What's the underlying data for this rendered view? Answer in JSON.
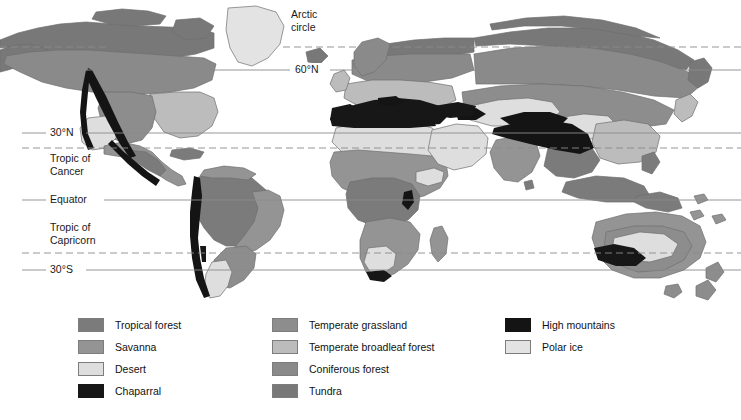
{
  "map": {
    "title": "World biomes map",
    "background_color": "#ffffff",
    "ocean_color": "#ffffff",
    "coastline_color": "#6e6e6e",
    "graticule_color": "#8a8a8a",
    "latitude_lines": [
      {
        "id": "arctic-circle",
        "label": "Arctic circle",
        "style": "dashed",
        "y": 47,
        "label_x": 292,
        "label_y": 10,
        "two_line": true,
        "line1": "Arctic",
        "line2": "circle"
      },
      {
        "id": "sixty-north",
        "label": "60°N",
        "style": "solid",
        "y": 70,
        "label_x": 296,
        "label_y": 63
      },
      {
        "id": "thirty-north",
        "label": "30°N",
        "style": "solid",
        "y": 133,
        "label_x": 52,
        "label_y": 126
      },
      {
        "id": "tropic-of-cancer",
        "label": "Tropic of Cancer",
        "style": "dashed",
        "y": 148,
        "label_x": 52,
        "label_y": 152,
        "two_line": true,
        "line1": "Tropic of",
        "line2": "Cancer"
      },
      {
        "id": "equator",
        "label": "Equator",
        "style": "solid",
        "y": 200,
        "label_x": 52,
        "label_y": 193
      },
      {
        "id": "tropic-of-capricorn",
        "label": "Tropic of Capricorn",
        "style": "dashed",
        "y": 253,
        "label_x": 52,
        "label_y": 227,
        "two_line": true,
        "line1": "Tropic of",
        "line2": "Capricorn"
      },
      {
        "id": "thirty-south",
        "label": "30°S",
        "style": "solid",
        "y": 270,
        "label_x": 52,
        "label_y": 263
      }
    ]
  },
  "legend": {
    "columns": [
      {
        "id": "legend-column-1",
        "x": 78,
        "items": [
          {
            "id": "tropical-forest",
            "label": "Tropical forest",
            "color": "#7b7b7b"
          },
          {
            "id": "savanna",
            "label": "Savanna",
            "color": "#949494"
          },
          {
            "id": "desert",
            "label": "Desert",
            "color": "#dedede"
          },
          {
            "id": "chaparral",
            "label": "Chaparral",
            "color": "#171717"
          }
        ]
      },
      {
        "id": "legend-column-2",
        "x": 272,
        "items": [
          {
            "id": "temperate-grassland",
            "label": "Temperate grassland",
            "color": "#8d8d8d"
          },
          {
            "id": "temperate-broadleaf-forest",
            "label": "Temperate broadleaf forest",
            "color": "#bcbcbc"
          },
          {
            "id": "coniferous-forest",
            "label": "Coniferous forest",
            "color": "#8a8a8a"
          },
          {
            "id": "tundra",
            "label": "Tundra",
            "color": "#787878"
          }
        ]
      },
      {
        "id": "legend-column-3",
        "x": 505,
        "items": [
          {
            "id": "high-mountains",
            "label": "High mountains",
            "color": "#141414"
          },
          {
            "id": "polar-ice",
            "label": "Polar ice",
            "color": "#e3e3e3"
          }
        ]
      }
    ]
  },
  "biome_colors": {
    "tropical_forest": "#7b7b7b",
    "savanna": "#949494",
    "desert": "#dedede",
    "chaparral": "#171717",
    "temperate_grassland": "#8d8d8d",
    "temperate_broadleaf_forest": "#bcbcbc",
    "coniferous_forest": "#8a8a8a",
    "tundra": "#787878",
    "high_mountains": "#141414",
    "polar_ice": "#e3e3e3"
  }
}
